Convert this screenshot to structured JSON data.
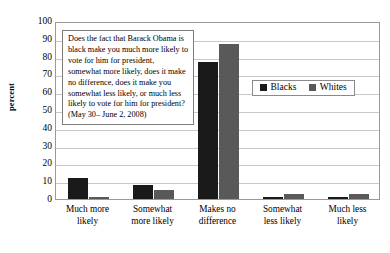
{
  "chart_data": {
    "type": "bar",
    "title": "",
    "subtitle": "",
    "xlabel": "",
    "ylabel": "percent",
    "ylim": [
      0,
      100
    ],
    "ytick_step": 10,
    "yticks": [
      100,
      90,
      80,
      70,
      60,
      50,
      40,
      30,
      20,
      10,
      0
    ],
    "grid": true,
    "legend_position": "inside-upper-right",
    "categories": [
      "Much more likely",
      "Somewhat more likely",
      "Makes no difference",
      "Somewhat less likely",
      "Much less likely"
    ],
    "category_lines": [
      [
        "Much more",
        "likely"
      ],
      [
        "Somewhat",
        "more likely"
      ],
      [
        "Makes no",
        "difference"
      ],
      [
        "Somewhat",
        "less likely"
      ],
      [
        "Much less",
        "likely"
      ]
    ],
    "series": [
      {
        "name": "Blacks",
        "color": "#1a1a1a",
        "values": [
          12,
          8,
          77,
          1,
          1
        ]
      },
      {
        "name": "Whites",
        "color": "#595959",
        "values": [
          1,
          5,
          87,
          3,
          3
        ]
      }
    ],
    "annotation": {
      "question": "Does the fact that Barack Obama is black make you much more likely to vote for him for president, somewhat more likely, does it make no difference, does it make you somewhat less likely, or much less likely to vote for him for president?",
      "date": "(May 30– June 2, 2008)"
    }
  }
}
